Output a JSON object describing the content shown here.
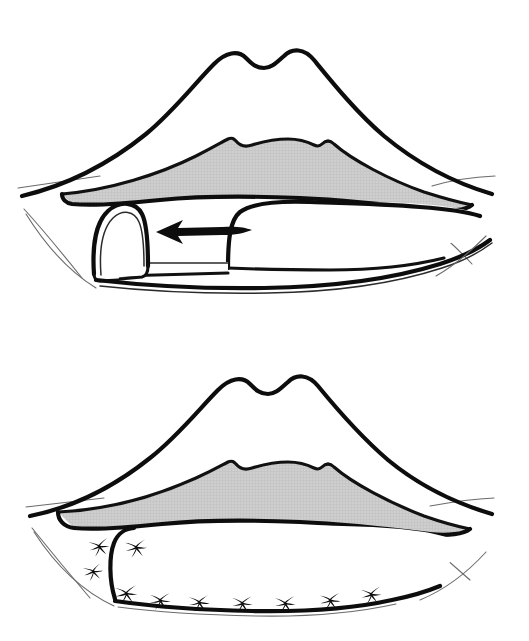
{
  "figure": {
    "panel_count": 2,
    "background_color": "#ffffff",
    "ink_color": "#0d0d0d",
    "vermilion_fill_color": "#cccccc",
    "white_fill_color": "#ffffff"
  },
  "panels": [
    {
      "id": "upper",
      "name": "flap-advancement-panel",
      "caption": "",
      "description": "Lips in repose; shaded vermilion of upper lip; a rounded mucosal advancement flap at the left commissure is mobilized medially as shown by the arrow",
      "arrow": {
        "name": "advancement-arrow",
        "direction": "left",
        "tip_x": 156,
        "tip_y": 232,
        "tail_x": 248,
        "tail_y": 231,
        "color": "#0d0d0d"
      },
      "flap": {
        "name": "mucosal-flap",
        "shape": "rounded-rectangle",
        "location": "left-commissure"
      }
    },
    {
      "id": "lower",
      "name": "sutured-closure-panel",
      "caption": "",
      "description": "Postoperative result; the donor site and advanced flap are closed with interrupted sutures shown as X marks along the lower lip",
      "suture_count": 10,
      "suture_symbol": "X",
      "sutures": [
        {
          "x": 99,
          "y": 547,
          "rot": -12,
          "scale": 1.0
        },
        {
          "x": 136,
          "y": 548,
          "rot": -8,
          "scale": 1.05
        },
        {
          "x": 93,
          "y": 572,
          "rot": -14,
          "scale": 0.95
        },
        {
          "x": 126,
          "y": 594,
          "rot": -6,
          "scale": 1.08
        },
        {
          "x": 160,
          "y": 601,
          "rot": -4,
          "scale": 1.02
        },
        {
          "x": 199,
          "y": 603,
          "rot": -5,
          "scale": 1.02
        },
        {
          "x": 242,
          "y": 604,
          "rot": -3,
          "scale": 1.0
        },
        {
          "x": 285,
          "y": 604,
          "rot": -4,
          "scale": 1.0
        },
        {
          "x": 330,
          "y": 601,
          "rot": -6,
          "scale": 1.0
        },
        {
          "x": 371,
          "y": 595,
          "rot": -8,
          "scale": 1.0
        }
      ]
    }
  ]
}
